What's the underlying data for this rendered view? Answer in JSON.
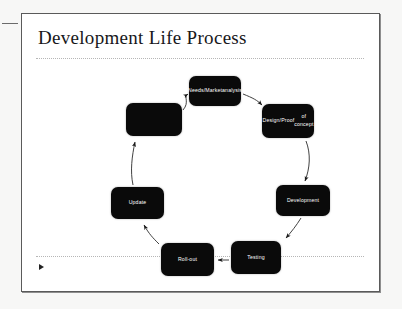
{
  "slide": {
    "title": "Development Life Process",
    "marker_icon": "play-triangle-icon"
  },
  "diagram": {
    "type": "cycle",
    "nodes": [
      {
        "id": "needs",
        "label_lines": [
          "Needs/Market",
          "analysis"
        ],
        "x": 167,
        "y": 18,
        "w": 52,
        "h": 30
      },
      {
        "id": "design",
        "label_lines": [
          "Design/Proof",
          "of concept"
        ],
        "x": 240,
        "y": 46,
        "w": 52,
        "h": 34
      },
      {
        "id": "development",
        "label_lines": [
          "Development"
        ],
        "x": 254,
        "y": 127,
        "w": 54,
        "h": 31
      },
      {
        "id": "testing",
        "label_lines": [
          "Testing"
        ],
        "x": 209,
        "y": 183,
        "w": 50,
        "h": 33
      },
      {
        "id": "rollout",
        "label_lines": [
          "Roll-out"
        ],
        "x": 139,
        "y": 185,
        "w": 53,
        "h": 33
      },
      {
        "id": "update",
        "label_lines": [
          "Update"
        ],
        "x": 89,
        "y": 129,
        "w": 53,
        "h": 32
      },
      {
        "id": "blank",
        "label_lines": [
          ""
        ],
        "x": 104,
        "y": 45,
        "w": 56,
        "h": 33
      }
    ],
    "edges": [
      {
        "from": "needs",
        "to": "design"
      },
      {
        "from": "design",
        "to": "development"
      },
      {
        "from": "development",
        "to": "testing"
      },
      {
        "from": "testing",
        "to": "rollout"
      },
      {
        "from": "rollout",
        "to": "update"
      },
      {
        "from": "update",
        "to": "blank"
      },
      {
        "from": "blank",
        "to": "needs"
      }
    ]
  },
  "colors": {
    "node_fill": "#0a0a0a",
    "node_text": "#ffffff",
    "title_text": "#17171a",
    "rule": "#b6b6b6",
    "slide_border": "#5a5a5a",
    "page_bg": "#f7f7f6"
  }
}
